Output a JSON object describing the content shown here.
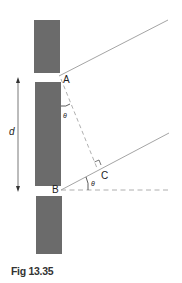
{
  "diagram": {
    "labels": {
      "point_a": "A",
      "point_b": "B",
      "point_c": "C",
      "theta_top": "θ",
      "theta_bottom": "θ",
      "separation": "d"
    },
    "colors": {
      "barrier": "#6b6b6b",
      "ray": "#9a9a9a",
      "dashed": "#9a9a9a",
      "arrow": "#555555",
      "text": "#222222"
    }
  },
  "caption": "Fig 13.35"
}
